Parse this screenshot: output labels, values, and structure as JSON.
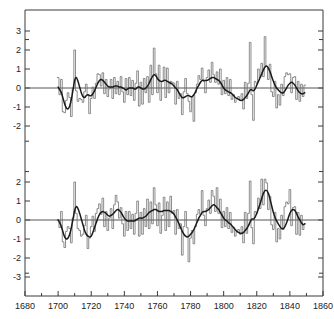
{
  "chart_data": {
    "type": "line",
    "title": "",
    "xlabel": "",
    "ylabel": "",
    "xlim": [
      1680,
      1860
    ],
    "grid": false,
    "legend": "none",
    "xticks": [
      1680,
      1700,
      1720,
      1740,
      1760,
      1780,
      1800,
      1820,
      1840,
      1860
    ],
    "xtick_labels": [
      "1680",
      "1700",
      "1720",
      "1740",
      "1760",
      "1780",
      "1800",
      "1820",
      "1840",
      "1860"
    ],
    "xminor_ticks": [
      1690,
      1710,
      1730,
      1750,
      1770,
      1790,
      1810,
      1830,
      1850
    ],
    "panels": [
      {
        "name": "top-panel",
        "ylim": [
          -2.8,
          3.6
        ],
        "yticks": [
          3,
          2,
          1,
          0,
          -1,
          -2
        ],
        "ytick_labels": [
          "3",
          "2",
          "1",
          "0",
          "-1",
          "-2"
        ],
        "zero_line": 0,
        "x": [
          1700,
          1701,
          1702,
          1703,
          1704,
          1705,
          1706,
          1707,
          1708,
          1709,
          1710,
          1711,
          1712,
          1713,
          1714,
          1715,
          1716,
          1717,
          1718,
          1719,
          1720,
          1721,
          1722,
          1723,
          1724,
          1725,
          1726,
          1727,
          1728,
          1729,
          1730,
          1731,
          1732,
          1733,
          1734,
          1735,
          1736,
          1737,
          1738,
          1739,
          1740,
          1741,
          1742,
          1743,
          1744,
          1745,
          1746,
          1747,
          1748,
          1749,
          1750,
          1751,
          1752,
          1753,
          1754,
          1755,
          1756,
          1757,
          1758,
          1759,
          1760,
          1761,
          1762,
          1763,
          1764,
          1765,
          1766,
          1767,
          1768,
          1769,
          1770,
          1771,
          1772,
          1773,
          1774,
          1775,
          1776,
          1777,
          1778,
          1779,
          1780,
          1781,
          1782,
          1783,
          1784,
          1785,
          1786,
          1787,
          1788,
          1789,
          1790,
          1791,
          1792,
          1793,
          1794,
          1795,
          1796,
          1797,
          1798,
          1799,
          1800,
          1801,
          1802,
          1803,
          1804,
          1805,
          1806,
          1807,
          1808,
          1809,
          1810,
          1811,
          1812,
          1813,
          1814,
          1815,
          1816,
          1817,
          1818,
          1819,
          1820,
          1821,
          1822,
          1823,
          1824,
          1825,
          1826,
          1827,
          1828,
          1829,
          1830,
          1831,
          1832,
          1833,
          1834,
          1835,
          1836,
          1837,
          1838,
          1839,
          1840,
          1841,
          1842,
          1843,
          1844,
          1845,
          1846,
          1847,
          1848,
          1849
        ],
        "series": [
          {
            "name": "annual",
            "style": "step",
            "values": [
              0.55,
              -0.35,
              0.45,
              -1.25,
              -1.3,
              -0.65,
              -0.25,
              -0.5,
              -1.5,
              -0.05,
              2.0,
              -0.15,
              -0.7,
              -0.55,
              -0.6,
              -0.75,
              -0.2,
              0.2,
              -0.35,
              -1.35,
              -0.55,
              0.05,
              -0.55,
              0.25,
              0.75,
              0.7,
              0.1,
              0.8,
              -0.3,
              0.45,
              -0.45,
              -0.05,
              0.45,
              -0.55,
              0.55,
              -0.3,
              0.35,
              -0.35,
              0.6,
              -0.2,
              -0.75,
              0.5,
              -0.35,
              0.55,
              -0.4,
              0.4,
              -0.65,
              0.25,
              0.9,
              -0.95,
              0.3,
              -0.85,
              0.5,
              -0.25,
              0.6,
              -0.75,
              1.2,
              -0.35,
              2.1,
              0.75,
              -0.25,
              1.2,
              -0.65,
              0.35,
              1.1,
              -0.5,
              1.05,
              -0.25,
              0.35,
              0.3,
              0.25,
              -0.85,
              0.35,
              -0.55,
              -0.3,
              -1.4,
              -0.2,
              0.5,
              -0.3,
              -0.7,
              -1.25,
              -0.45,
              -1.75,
              -0.25,
              0.2,
              0.65,
              0.45,
              1.05,
              0.35,
              -0.25,
              0.55,
              0.95,
              0.3,
              1.35,
              0.7,
              0.3,
              0.85,
              0.2,
              1.0,
              -0.35,
              0.4,
              -0.3,
              0.55,
              -0.4,
              0.45,
              -0.6,
              -0.35,
              -0.75,
              -0.55,
              -0.45,
              -0.65,
              -0.3,
              -1.1,
              0.3,
              -0.55,
              0.25,
              2.4,
              -0.35,
              -1.7,
              0.35,
              0.25,
              1.0,
              0.55,
              1.3,
              0.6,
              2.7,
              1.15,
              0.45,
              1.25,
              -0.2,
              -0.45,
              0.35,
              -1.05,
              -0.35,
              -0.9,
              0.2,
              -0.4,
              0.6,
              0.8,
              0.7,
              0.75,
              -0.25,
              0.55,
              0.6,
              -0.6,
              0.35,
              -0.7,
              0.2,
              -0.45,
              0.15
            ]
          },
          {
            "name": "smoothed",
            "style": "smooth",
            "values": [
              0.05,
              -0.1,
              -0.25,
              -0.55,
              -0.85,
              -1.05,
              -1.1,
              -0.95,
              -0.6,
              -0.1,
              0.4,
              0.55,
              0.35,
              0.05,
              -0.25,
              -0.45,
              -0.5,
              -0.4,
              -0.35,
              -0.4,
              -0.4,
              -0.3,
              -0.15,
              0.05,
              0.25,
              0.4,
              0.45,
              0.4,
              0.3,
              0.2,
              0.1,
              0.05,
              0.05,
              0.05,
              0.1,
              0.1,
              0.1,
              0.05,
              0.05,
              0.0,
              -0.05,
              -0.1,
              -0.05,
              0.0,
              0.0,
              0.0,
              -0.05,
              -0.05,
              0.05,
              0.05,
              0.0,
              -0.05,
              -0.05,
              0.0,
              0.1,
              0.25,
              0.45,
              0.6,
              0.7,
              0.65,
              0.5,
              0.4,
              0.35,
              0.35,
              0.4,
              0.4,
              0.35,
              0.3,
              0.25,
              0.2,
              0.1,
              0.0,
              -0.1,
              -0.25,
              -0.4,
              -0.5,
              -0.5,
              -0.45,
              -0.4,
              -0.4,
              -0.45,
              -0.45,
              -0.35,
              -0.2,
              0.0,
              0.15,
              0.3,
              0.4,
              0.4,
              0.4,
              0.4,
              0.45,
              0.5,
              0.55,
              0.55,
              0.5,
              0.45,
              0.4,
              0.3,
              0.15,
              0.0,
              -0.1,
              -0.15,
              -0.2,
              -0.25,
              -0.3,
              -0.4,
              -0.5,
              -0.55,
              -0.6,
              -0.65,
              -0.65,
              -0.6,
              -0.5,
              -0.4,
              -0.25,
              -0.1,
              -0.1,
              -0.15,
              -0.05,
              0.15,
              0.35,
              0.55,
              0.75,
              0.95,
              1.1,
              1.15,
              1.05,
              0.85,
              0.6,
              0.35,
              0.15,
              0.0,
              -0.1,
              -0.2,
              -0.25,
              -0.25,
              -0.15,
              0.0,
              0.15,
              0.25,
              0.3,
              0.25,
              0.15,
              0.0,
              -0.15,
              -0.25,
              -0.3,
              -0.3,
              -0.25
            ]
          }
        ]
      },
      {
        "name": "bottom-panel",
        "ylim": [
          -3.6,
          2.6
        ],
        "yticks": [
          2,
          1,
          0,
          -1,
          -2,
          -3
        ],
        "ytick_labels": [
          "2",
          "1",
          "0",
          "-1",
          "-2",
          "-3"
        ],
        "zero_line": 0,
        "x": [
          1700,
          1701,
          1702,
          1703,
          1704,
          1705,
          1706,
          1707,
          1708,
          1709,
          1710,
          1711,
          1712,
          1713,
          1714,
          1715,
          1716,
          1717,
          1718,
          1719,
          1720,
          1721,
          1722,
          1723,
          1724,
          1725,
          1726,
          1727,
          1728,
          1729,
          1730,
          1731,
          1732,
          1733,
          1734,
          1735,
          1736,
          1737,
          1738,
          1739,
          1740,
          1741,
          1742,
          1743,
          1744,
          1745,
          1746,
          1747,
          1748,
          1749,
          1750,
          1751,
          1752,
          1753,
          1754,
          1755,
          1756,
          1757,
          1758,
          1759,
          1760,
          1761,
          1762,
          1763,
          1764,
          1765,
          1766,
          1767,
          1768,
          1769,
          1770,
          1771,
          1772,
          1773,
          1774,
          1775,
          1776,
          1777,
          1778,
          1779,
          1780,
          1781,
          1782,
          1783,
          1784,
          1785,
          1786,
          1787,
          1788,
          1789,
          1790,
          1791,
          1792,
          1793,
          1794,
          1795,
          1796,
          1797,
          1798,
          1799,
          1800,
          1801,
          1802,
          1803,
          1804,
          1805,
          1806,
          1807,
          1808,
          1809,
          1810,
          1811,
          1812,
          1813,
          1814,
          1815,
          1816,
          1817,
          1818,
          1819,
          1820,
          1821,
          1822,
          1823,
          1824,
          1825,
          1826,
          1827,
          1828,
          1829,
          1830,
          1831,
          1832,
          1833,
          1834,
          1835,
          1836,
          1837,
          1838,
          1839,
          1840,
          1841,
          1842,
          1843,
          1844,
          1845,
          1846,
          1847,
          1848,
          1849
        ],
        "series": [
          {
            "name": "annual",
            "style": "step",
            "values": [
              0.0,
              -0.4,
              0.45,
              -1.15,
              -1.45,
              -0.6,
              -0.35,
              -0.45,
              -1.2,
              0.1,
              2.0,
              0.35,
              -0.45,
              -0.55,
              -0.85,
              -0.75,
              -0.3,
              0.25,
              -1.5,
              -0.95,
              -0.35,
              0.2,
              -0.6,
              0.35,
              0.6,
              0.85,
              0.3,
              1.15,
              -0.35,
              0.45,
              -0.55,
              0.1,
              0.6,
              -0.45,
              0.8,
              1.3,
              0.95,
              0.1,
              0.65,
              -0.2,
              -0.85,
              0.45,
              -0.55,
              0.45,
              -0.45,
              0.3,
              -0.75,
              0.35,
              1.0,
              -0.85,
              0.4,
              -0.75,
              0.6,
              -0.35,
              1.1,
              -0.45,
              0.95,
              -0.2,
              1.7,
              0.8,
              -0.3,
              0.9,
              -0.7,
              0.25,
              1.2,
              -0.55,
              0.95,
              -0.35,
              1.25,
              0.35,
              0.5,
              -0.75,
              0.55,
              -0.45,
              -0.2,
              -1.85,
              -0.35,
              0.45,
              -0.4,
              -2.2,
              -0.95,
              -0.55,
              -1.25,
              -0.35,
              0.3,
              0.55,
              0.3,
              1.55,
              0.25,
              -0.3,
              0.6,
              1.05,
              0.35,
              1.55,
              1.25,
              0.45,
              1.7,
              0.35,
              1.1,
              -0.4,
              0.45,
              -0.35,
              0.65,
              -0.45,
              0.4,
              -0.65,
              -0.4,
              -0.85,
              -0.6,
              -0.5,
              -0.75,
              -0.35,
              -1.2,
              0.4,
              -0.7,
              0.35,
              2.05,
              -0.4,
              -1.25,
              0.45,
              0.35,
              1.15,
              0.6,
              2.15,
              0.8,
              2.15,
              1.95,
              0.55,
              1.25,
              -0.25,
              -0.5,
              0.4,
              -1.15,
              -0.45,
              -1.0,
              0.25,
              -0.5,
              0.7,
              0.95,
              0.85,
              1.6,
              -0.3,
              0.65,
              0.7,
              -0.75,
              0.4,
              -0.8,
              0.25,
              -0.5,
              -0.2
            ]
          },
          {
            "name": "smoothed",
            "style": "smooth",
            "values": [
              0.0,
              -0.15,
              -0.35,
              -0.65,
              -0.9,
              -1.0,
              -0.95,
              -0.75,
              -0.4,
              0.05,
              0.5,
              0.7,
              0.6,
              0.35,
              0.05,
              -0.25,
              -0.55,
              -0.75,
              -0.85,
              -0.9,
              -0.85,
              -0.65,
              -0.4,
              -0.15,
              0.1,
              0.3,
              0.4,
              0.45,
              0.4,
              0.35,
              0.25,
              0.2,
              0.25,
              0.3,
              0.4,
              0.5,
              0.55,
              0.5,
              0.4,
              0.25,
              0.1,
              0.0,
              -0.05,
              -0.05,
              -0.05,
              -0.05,
              -0.05,
              0.0,
              0.05,
              0.1,
              0.1,
              0.1,
              0.15,
              0.2,
              0.3,
              0.4,
              0.45,
              0.5,
              0.55,
              0.55,
              0.5,
              0.45,
              0.45,
              0.45,
              0.5,
              0.5,
              0.5,
              0.5,
              0.45,
              0.4,
              0.3,
              0.15,
              0.0,
              -0.2,
              -0.4,
              -0.6,
              -0.75,
              -0.85,
              -0.9,
              -0.85,
              -0.75,
              -0.65,
              -0.5,
              -0.3,
              -0.1,
              0.1,
              0.25,
              0.4,
              0.45,
              0.45,
              0.5,
              0.55,
              0.65,
              0.75,
              0.8,
              0.75,
              0.65,
              0.55,
              0.4,
              0.25,
              0.1,
              0.0,
              -0.05,
              -0.15,
              -0.2,
              -0.3,
              -0.4,
              -0.5,
              -0.6,
              -0.65,
              -0.7,
              -0.7,
              -0.65,
              -0.55,
              -0.45,
              -0.3,
              -0.1,
              0.05,
              0.05,
              0.15,
              0.35,
              0.6,
              0.85,
              1.15,
              1.4,
              1.55,
              1.55,
              1.4,
              1.1,
              0.75,
              0.4,
              0.15,
              -0.05,
              -0.2,
              -0.35,
              -0.45,
              -0.45,
              -0.35,
              -0.15,
              0.1,
              0.35,
              0.5,
              0.55,
              0.5,
              0.35,
              0.15,
              0.0,
              -0.15,
              -0.25,
              -0.2
            ]
          }
        ]
      }
    ],
    "colors": {
      "annual": "#6e6e6e",
      "smoothed": "#1a1a1a",
      "axis": "#3a3a3a",
      "zero_line": "#555555",
      "background": "#ffffff"
    }
  }
}
